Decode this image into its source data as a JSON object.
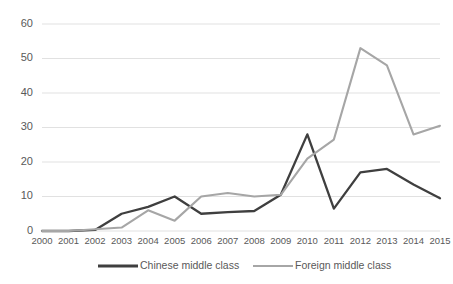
{
  "chart_data": {
    "type": "line",
    "title": "",
    "subtitle": "",
    "xlabel": "",
    "ylabel": "",
    "categories": [
      "2000",
      "2001",
      "2002",
      "2003",
      "2004",
      "2005",
      "2006",
      "2007",
      "2008",
      "2009",
      "2010",
      "2011",
      "2012",
      "2013",
      "2014",
      "2015"
    ],
    "x": [
      2000,
      2001,
      2002,
      2003,
      2004,
      2005,
      2006,
      2007,
      2008,
      2009,
      2010,
      2011,
      2012,
      2013,
      2014,
      2015
    ],
    "series": [
      {
        "name": "Chinese middle class",
        "color": "#3f3f3f",
        "values": [
          0,
          0,
          0.3,
          5,
          7,
          10,
          5,
          5.5,
          5.8,
          10.5,
          28,
          6.5,
          17,
          18,
          13.5,
          9.5
        ]
      },
      {
        "name": "Foreign middle class",
        "color": "#a6a6a6",
        "values": [
          0,
          0,
          0.5,
          1,
          6,
          3,
          10,
          11,
          10,
          10.5,
          21,
          26.5,
          53,
          48,
          28,
          30.5
        ]
      }
    ],
    "ylim": [
      0,
      60
    ],
    "yticks": [
      0,
      10,
      20,
      30,
      40,
      50,
      60
    ],
    "ytick_labels": [
      "0",
      "10",
      "20",
      "30",
      "40",
      "50",
      "60"
    ],
    "grid": true,
    "grid_color": "#d9d9d9",
    "legend_position": "bottom",
    "background": "#ffffff",
    "axis_text_color": "#595959"
  },
  "legend": {
    "items": [
      {
        "label": "Chinese middle class",
        "color": "#3f3f3f"
      },
      {
        "label": "Foreign middle class",
        "color": "#a6a6a6"
      }
    ]
  }
}
